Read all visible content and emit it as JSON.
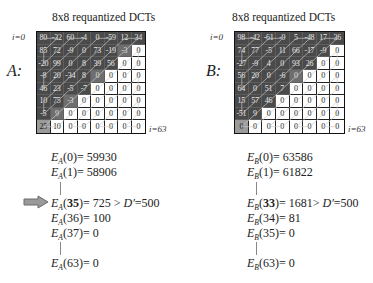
{
  "panels": [
    {
      "id": "A",
      "title": "8x8 requantized DCTs",
      "side_label": "A:",
      "start_label": "i=0",
      "end_label": "i=63",
      "grid": {
        "values": [
          [
            "80",
            "-32",
            "60",
            "-4",
            "0",
            "-59",
            "12",
            "34"
          ],
          [
            "85",
            "72",
            "-9",
            "0",
            "73",
            "-19",
            "-3",
            "0"
          ],
          [
            "-20",
            "99",
            "0",
            "8",
            "39",
            "56",
            "0",
            "0"
          ],
          [
            "-8",
            "20",
            "-34",
            "8",
            "0",
            "0",
            "0",
            "0"
          ],
          [
            "46",
            "23",
            "-5",
            "-7",
            "0",
            "0",
            "0",
            "0"
          ],
          [
            "10",
            "75",
            "-3",
            "0",
            "0",
            "0",
            "0",
            "0"
          ],
          [
            "-5",
            "9",
            "0",
            "0",
            "0",
            "0",
            "0",
            "0"
          ],
          [
            "25",
            "10",
            "0",
            "0",
            "0",
            "0",
            "0",
            "0"
          ]
        ],
        "shade": [
          [
            "d",
            "d",
            "d",
            "d",
            "d",
            "d",
            "d",
            "d"
          ],
          [
            "d",
            "d",
            "d",
            "d",
            "d",
            "d",
            "m",
            "w"
          ],
          [
            "d",
            "d",
            "d",
            "d",
            "d",
            "d",
            "w",
            "w"
          ],
          [
            "d",
            "d",
            "d",
            "d",
            "m",
            "w",
            "w",
            "w"
          ],
          [
            "d",
            "d",
            "d",
            "d",
            "w",
            "w",
            "w",
            "w"
          ],
          [
            "d",
            "d",
            "m",
            "w",
            "w",
            "w",
            "w",
            "w"
          ],
          [
            "d",
            "m",
            "w",
            "w",
            "w",
            "w",
            "w",
            "w"
          ],
          [
            "l",
            "w",
            "w",
            "w",
            "w",
            "w",
            "w",
            "w"
          ]
        ]
      },
      "energies": [
        {
          "prefix": "E",
          "sub": "A",
          "index": "0",
          "bold": false,
          "value": "= 59930",
          "suffix": ""
        },
        {
          "prefix": "E",
          "sub": "A",
          "index": "1",
          "bold": false,
          "value": "= 58906",
          "suffix": ""
        },
        {
          "gap": true
        },
        {
          "prefix": "E",
          "sub": "A",
          "index": "35",
          "bold": true,
          "value": "= 725 > ",
          "suffix": "D′",
          "tail": "=500",
          "marked": true
        },
        {
          "prefix": "E",
          "sub": "A",
          "index": "36",
          "bold": false,
          "value": "= 100",
          "suffix": ""
        },
        {
          "prefix": "E",
          "sub": "A",
          "index": "37",
          "bold": false,
          "value": "= 0",
          "suffix": ""
        },
        {
          "gap": true
        },
        {
          "prefix": "E",
          "sub": "A",
          "index": "63",
          "bold": false,
          "value": "= 0",
          "suffix": ""
        }
      ]
    },
    {
      "id": "B",
      "title": "8x8 requantized DCTs",
      "side_label": "B:",
      "start_label": "i=0",
      "end_label": "i=63",
      "grid": {
        "values": [
          [
            "98",
            "-42",
            "-61",
            "-9",
            "5",
            "-48",
            "17",
            "36"
          ],
          [
            "74",
            "77",
            "-5",
            "11",
            "66",
            "-17",
            "-9",
            "0"
          ],
          [
            "-27",
            "-9",
            "4",
            "0",
            "93",
            "26",
            "0",
            "0"
          ],
          [
            "56",
            "20",
            "0",
            "-6",
            "0",
            "0",
            "0",
            "0"
          ],
          [
            "64",
            "0",
            "51",
            "7",
            "0",
            "0",
            "0",
            "0"
          ],
          [
            "15",
            "57",
            "46",
            "0",
            "0",
            "0",
            "0",
            "0"
          ],
          [
            "-51",
            "9",
            "0",
            "0",
            "0",
            "0",
            "0",
            "0"
          ],
          [
            "0",
            "0",
            "0",
            "0",
            "0",
            "0",
            "0",
            "0"
          ]
        ],
        "shade": [
          [
            "d",
            "d",
            "d",
            "d",
            "d",
            "d",
            "d",
            "d"
          ],
          [
            "d",
            "d",
            "d",
            "d",
            "d",
            "d",
            "d",
            "w"
          ],
          [
            "d",
            "d",
            "d",
            "d",
            "d",
            "d",
            "w",
            "w"
          ],
          [
            "d",
            "d",
            "d",
            "d",
            "m",
            "w",
            "w",
            "w"
          ],
          [
            "d",
            "d",
            "d",
            "d",
            "w",
            "w",
            "w",
            "w"
          ],
          [
            "d",
            "d",
            "d",
            "w",
            "w",
            "w",
            "w",
            "w"
          ],
          [
            "d",
            "d",
            "w",
            "w",
            "w",
            "w",
            "w",
            "w"
          ],
          [
            "l",
            "w",
            "w",
            "w",
            "w",
            "w",
            "w",
            "w"
          ]
        ]
      },
      "energies": [
        {
          "prefix": "E",
          "sub": "B",
          "index": "0",
          "bold": false,
          "value": "= 63586",
          "suffix": ""
        },
        {
          "prefix": "E",
          "sub": "B",
          "index": "1",
          "bold": false,
          "value": "= 61822",
          "suffix": ""
        },
        {
          "gap": true
        },
        {
          "prefix": "E",
          "sub": "B",
          "index": "33",
          "bold": true,
          "value": "= 1681> ",
          "suffix": "D′",
          "tail": "=500",
          "marked": false
        },
        {
          "prefix": "E",
          "sub": "B",
          "index": "34",
          "bold": false,
          "value": "= 81",
          "suffix": ""
        },
        {
          "prefix": "E",
          "sub": "B",
          "index": "35",
          "bold": false,
          "value": "= 0",
          "suffix": ""
        },
        {
          "gap": true
        },
        {
          "prefix": "E",
          "sub": "B",
          "index": "63",
          "bold": false,
          "value": "= 0",
          "suffix": ""
        }
      ]
    }
  ],
  "marker": {
    "icon": "right-arrow-icon",
    "fill": "#9a9a9a",
    "stroke": "#6a6a6a"
  },
  "colors": {
    "dark_cell": "#4a4a4a",
    "boundary_cell": "#6e6e6e",
    "dc_cell": "#9a9a9a",
    "zero_cell": "#ffffff",
    "zigzag_line": "#c8c8c8"
  }
}
